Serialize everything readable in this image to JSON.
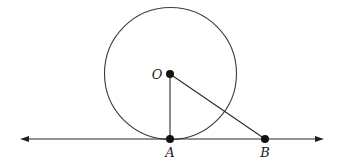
{
  "diagram": {
    "type": "geometry-tangent-line",
    "circle": {
      "center": "O",
      "cx": 170.5,
      "cy": 73.5,
      "r": 66
    },
    "points": [
      {
        "id": "O",
        "label": "O",
        "x": 170,
        "y": 74,
        "label_x": 157,
        "label_y": 79,
        "anchor": "middle"
      },
      {
        "id": "A",
        "label": "A",
        "x": 170,
        "y": 139,
        "label_x": 170,
        "label_y": 157,
        "anchor": "middle"
      },
      {
        "id": "B",
        "label": "B",
        "x": 265,
        "y": 139,
        "label_x": 265,
        "label_y": 157,
        "anchor": "middle"
      }
    ],
    "segments": [
      {
        "from": "O",
        "to": "A"
      },
      {
        "from": "O",
        "to": "B"
      }
    ],
    "tangent_line": {
      "x1": 20,
      "x2": 324,
      "y": 139,
      "arrows": "both",
      "through": [
        "A",
        "B"
      ]
    },
    "colors": {
      "stroke": "#3a3a3a",
      "point": "#111111",
      "background": "#ffffff"
    }
  }
}
